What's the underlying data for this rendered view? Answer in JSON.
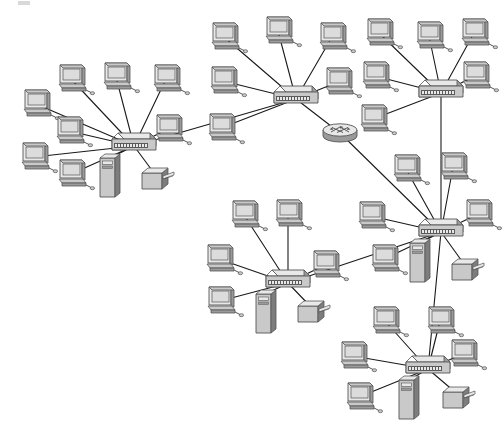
{
  "diagram": {
    "type": "network-topology",
    "style": "grayscale 3d clipart",
    "background_color": "#ffffff",
    "link_color": "#1a1a1a",
    "link_width": 1.1,
    "palette": {
      "body_light": "#e8e8e8",
      "body_mid": "#c9c9c9",
      "body_dark": "#9a9a9a",
      "body_darker": "#7d7d7d",
      "screen": "#dcdcdc",
      "outline": "#555555",
      "port_strip": "#5a5a5a"
    },
    "clusters": [
      {
        "id": "cluster-left",
        "name": "left-lan",
        "switch": {
          "x": 110,
          "y": 129
        },
        "node_count": 9
      },
      {
        "id": "cluster-top-center",
        "name": "top-center-lan",
        "switch": {
          "x": 272,
          "y": 82
        },
        "node_count": 6
      },
      {
        "id": "cluster-top-right",
        "name": "top-right-lan",
        "switch": {
          "x": 417,
          "y": 76
        },
        "node_count": 6
      },
      {
        "id": "cluster-right-middle",
        "name": "right-middle-lan",
        "switch": {
          "x": 417,
          "y": 215
        },
        "node_count": 7
      },
      {
        "id": "cluster-bottom-center",
        "name": "bottom-center-lan",
        "switch": {
          "x": 264,
          "y": 266
        },
        "node_count": 7
      },
      {
        "id": "cluster-bottom-right",
        "name": "bottom-right-lan",
        "switch": {
          "x": 404,
          "y": 352
        },
        "node_count": 7
      }
    ],
    "router": {
      "id": "router-core",
      "name": "core-router",
      "x": 321,
      "y": 121,
      "label": ""
    },
    "trunk_links": [
      {
        "from": "cluster-left",
        "to": "cluster-top-center"
      },
      {
        "from": "cluster-top-center",
        "to": "router-core"
      },
      {
        "from": "router-core",
        "to": "cluster-right-middle"
      },
      {
        "from": "cluster-top-right",
        "to": "cluster-right-middle"
      },
      {
        "from": "cluster-right-middle",
        "to": "cluster-bottom-right"
      },
      {
        "from": "cluster-bottom-center",
        "to": "cluster-right-middle"
      }
    ],
    "workstations": [
      {
        "id": "ws-l1",
        "x": 20,
        "y": 88,
        "cluster": "cluster-left"
      },
      {
        "id": "ws-l2",
        "x": 55,
        "y": 63,
        "cluster": "cluster-left"
      },
      {
        "id": "ws-l3",
        "x": 100,
        "y": 61,
        "cluster": "cluster-left"
      },
      {
        "id": "ws-l4",
        "x": 150,
        "y": 63,
        "cluster": "cluster-left"
      },
      {
        "id": "ws-l5",
        "x": 53,
        "y": 115,
        "cluster": "cluster-left"
      },
      {
        "id": "ws-l6",
        "x": 18,
        "y": 141,
        "cluster": "cluster-left"
      },
      {
        "id": "ws-l7",
        "x": 55,
        "y": 158,
        "cluster": "cluster-left"
      },
      {
        "id": "ws-l8",
        "x": 152,
        "y": 113,
        "cluster": "cluster-left"
      },
      {
        "id": "ws-t1",
        "x": 208,
        "y": 21,
        "cluster": "cluster-top-center"
      },
      {
        "id": "ws-t2",
        "x": 262,
        "y": 15,
        "cluster": "cluster-top-center"
      },
      {
        "id": "ws-t3",
        "x": 316,
        "y": 21,
        "cluster": "cluster-top-center"
      },
      {
        "id": "ws-t4",
        "x": 207,
        "y": 65,
        "cluster": "cluster-top-center"
      },
      {
        "id": "ws-t5",
        "x": 322,
        "y": 66,
        "cluster": "cluster-top-center"
      },
      {
        "id": "ws-t6",
        "x": 205,
        "y": 112,
        "cluster": "cluster-top-center"
      },
      {
        "id": "ws-r1",
        "x": 363,
        "y": 17,
        "cluster": "cluster-top-right"
      },
      {
        "id": "ws-r2",
        "x": 413,
        "y": 20,
        "cluster": "cluster-top-right"
      },
      {
        "id": "ws-r3",
        "x": 458,
        "y": 17,
        "cluster": "cluster-top-right"
      },
      {
        "id": "ws-r4",
        "x": 359,
        "y": 60,
        "cluster": "cluster-top-right"
      },
      {
        "id": "ws-r5",
        "x": 459,
        "y": 60,
        "cluster": "cluster-top-right"
      },
      {
        "id": "ws-r6",
        "x": 357,
        "y": 103,
        "cluster": "cluster-top-right"
      },
      {
        "id": "ws-m1",
        "x": 390,
        "y": 153,
        "cluster": "cluster-right-middle"
      },
      {
        "id": "ws-m2",
        "x": 437,
        "y": 151,
        "cluster": "cluster-right-middle"
      },
      {
        "id": "ws-m3",
        "x": 355,
        "y": 200,
        "cluster": "cluster-right-middle"
      },
      {
        "id": "ws-m4",
        "x": 462,
        "y": 198,
        "cluster": "cluster-right-middle"
      },
      {
        "id": "ws-m5",
        "x": 368,
        "y": 243,
        "cluster": "cluster-right-middle"
      },
      {
        "id": "ws-b1",
        "x": 228,
        "y": 199,
        "cluster": "cluster-bottom-center"
      },
      {
        "id": "ws-b2",
        "x": 272,
        "y": 198,
        "cluster": "cluster-bottom-center"
      },
      {
        "id": "ws-b3",
        "x": 203,
        "y": 243,
        "cluster": "cluster-bottom-center"
      },
      {
        "id": "ws-b4",
        "x": 309,
        "y": 249,
        "cluster": "cluster-bottom-center"
      },
      {
        "id": "ws-b5",
        "x": 204,
        "y": 285,
        "cluster": "cluster-bottom-center"
      },
      {
        "id": "ws-q1",
        "x": 369,
        "y": 305,
        "cluster": "cluster-bottom-right"
      },
      {
        "id": "ws-q2",
        "x": 424,
        "y": 305,
        "cluster": "cluster-bottom-right"
      },
      {
        "id": "ws-q3",
        "x": 337,
        "y": 340,
        "cluster": "cluster-bottom-right"
      },
      {
        "id": "ws-q4",
        "x": 447,
        "y": 338,
        "cluster": "cluster-bottom-right"
      },
      {
        "id": "ws-q5",
        "x": 343,
        "y": 381,
        "cluster": "cluster-bottom-right"
      }
    ],
    "servers": [
      {
        "id": "srv-left",
        "x": 97,
        "y": 152,
        "cluster": "cluster-left"
      },
      {
        "id": "srv-right-middle",
        "x": 407,
        "y": 237,
        "cluster": "cluster-right-middle"
      },
      {
        "id": "srv-bottom-center",
        "x": 253,
        "y": 288,
        "cluster": "cluster-bottom-center"
      },
      {
        "id": "srv-bottom-right",
        "x": 396,
        "y": 374,
        "cluster": "cluster-bottom-right"
      }
    ],
    "printers": [
      {
        "id": "prn-left",
        "x": 140,
        "y": 163,
        "cluster": "cluster-left"
      },
      {
        "id": "prn-right-middle",
        "x": 450,
        "y": 254,
        "cluster": "cluster-right-middle"
      },
      {
        "id": "prn-bottom-center",
        "x": 296,
        "y": 296,
        "cluster": "cluster-bottom-center"
      },
      {
        "id": "prn-bottom-right",
        "x": 441,
        "y": 382,
        "cluster": "cluster-bottom-right"
      }
    ]
  }
}
